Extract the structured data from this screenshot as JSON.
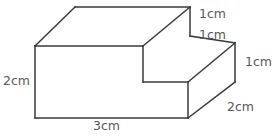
{
  "figure": {
    "name": "step-shaped-rectangular-solid",
    "type": "3d-geometry-diagram",
    "stroke_color": "#3a3a3c",
    "label_color": "#58585a",
    "background_color": "#ffffff",
    "stroke_width": 1.5,
    "labels": {
      "top_step_height": "1cm",
      "top_step_depth": "1cm",
      "right_height": "1cm",
      "left_height": "2cm",
      "right_depth": "2cm",
      "bottom_width": "3cm"
    },
    "vertices": {
      "top_back_left": [
        75,
        7
      ],
      "top_back_right": [
        190,
        7
      ],
      "top_front_left": [
        35,
        46
      ],
      "top_front_step": [
        143,
        46
      ],
      "step_riser_bottom": [
        190,
        36
      ],
      "step_inner_front": [
        143,
        82
      ],
      "step_inner_right": [
        188,
        82
      ],
      "lower_top_back_right": [
        235,
        43
      ],
      "lower_top_front_right": [
        188,
        82
      ],
      "front_bottom_left": [
        35,
        118
      ],
      "front_bottom_right": [
        188,
        118
      ],
      "right_bottom": [
        235,
        82
      ]
    },
    "edges": [
      "top-back-left to top-back-right",
      "top-back-left to top-front-left",
      "top-back-right to top-front-step",
      "top-front-left to top-front-step",
      "top-back-right to step-riser-bottom",
      "step-riser-bottom to lower-top-back-right",
      "top-front-step to step-inner-front",
      "step-inner-front to step-inner-right",
      "step-inner-right to lower-top-back-right",
      "lower-top-back-right to right-bottom",
      "step-inner-right to front-bottom-right",
      "front-bottom-right to right-bottom",
      "top-front-left to front-bottom-left",
      "front-bottom-left to front-bottom-right"
    ]
  }
}
